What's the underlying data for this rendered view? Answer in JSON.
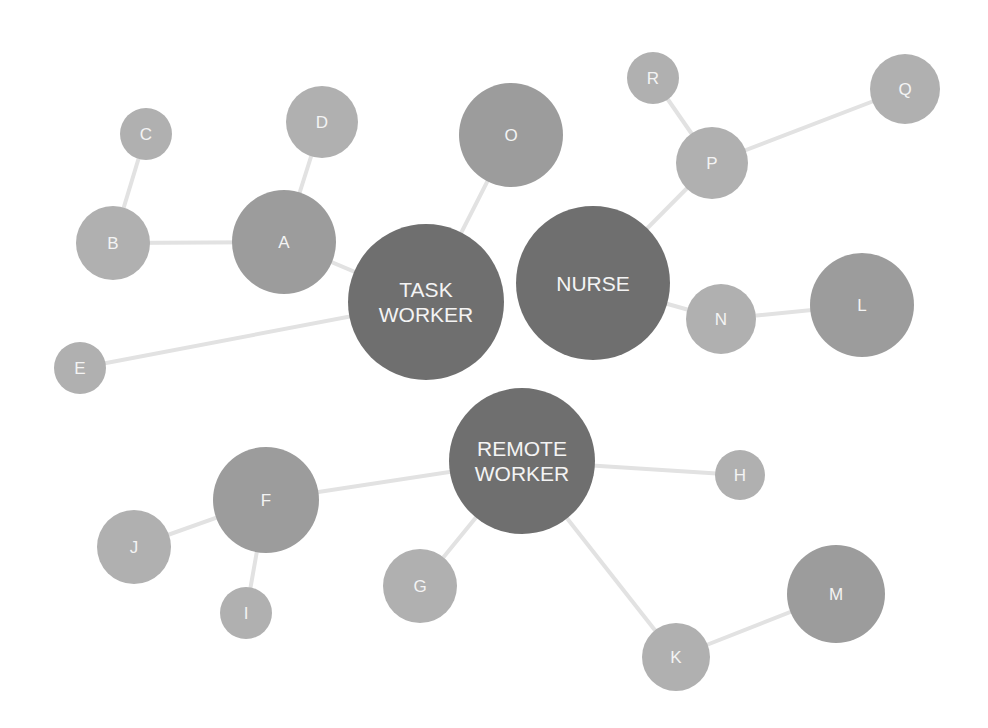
{
  "diagram": {
    "type": "network",
    "colors": {
      "background": "#ffffff",
      "edge": "#e2e2e2",
      "hub_fill": "#6f6f6f",
      "large_leaf_fill": "#9c9c9c",
      "leaf_fill": "#b0b0b0",
      "label": "#f4f4f4"
    },
    "nodes": [
      {
        "id": "task_worker",
        "label_lines": [
          "TASK",
          "WORKER"
        ],
        "x": 426,
        "y": 302,
        "r": 78,
        "kind": "hub"
      },
      {
        "id": "nurse",
        "label_lines": [
          "NURSE"
        ],
        "x": 593,
        "y": 283,
        "r": 77,
        "kind": "hub"
      },
      {
        "id": "remote_worker",
        "label_lines": [
          "REMOTE",
          "WORKER"
        ],
        "x": 522,
        "y": 461,
        "r": 73,
        "kind": "hub"
      },
      {
        "id": "A",
        "label_lines": [
          "A"
        ],
        "x": 284,
        "y": 242,
        "r": 52,
        "kind": "large"
      },
      {
        "id": "B",
        "label_lines": [
          "B"
        ],
        "x": 113,
        "y": 243,
        "r": 37,
        "kind": "leaf"
      },
      {
        "id": "C",
        "label_lines": [
          "C"
        ],
        "x": 146,
        "y": 134,
        "r": 26,
        "kind": "leaf"
      },
      {
        "id": "D",
        "label_lines": [
          "D"
        ],
        "x": 322,
        "y": 122,
        "r": 36,
        "kind": "leaf"
      },
      {
        "id": "E",
        "label_lines": [
          "E"
        ],
        "x": 80,
        "y": 368,
        "r": 26,
        "kind": "leaf"
      },
      {
        "id": "F",
        "label_lines": [
          "F"
        ],
        "x": 266,
        "y": 500,
        "r": 53,
        "kind": "large"
      },
      {
        "id": "G",
        "label_lines": [
          "G"
        ],
        "x": 420,
        "y": 586,
        "r": 37,
        "kind": "leaf"
      },
      {
        "id": "H",
        "label_lines": [
          "H"
        ],
        "x": 740,
        "y": 475,
        "r": 25,
        "kind": "leaf"
      },
      {
        "id": "I",
        "label_lines": [
          "I"
        ],
        "x": 246,
        "y": 613,
        "r": 26,
        "kind": "leaf"
      },
      {
        "id": "J",
        "label_lines": [
          "J"
        ],
        "x": 134,
        "y": 547,
        "r": 37,
        "kind": "leaf"
      },
      {
        "id": "K",
        "label_lines": [
          "K"
        ],
        "x": 676,
        "y": 657,
        "r": 34,
        "kind": "leaf"
      },
      {
        "id": "L",
        "label_lines": [
          "L"
        ],
        "x": 862,
        "y": 305,
        "r": 52,
        "kind": "large"
      },
      {
        "id": "M",
        "label_lines": [
          "M"
        ],
        "x": 836,
        "y": 594,
        "r": 49,
        "kind": "large"
      },
      {
        "id": "N",
        "label_lines": [
          "N"
        ],
        "x": 721,
        "y": 319,
        "r": 35,
        "kind": "leaf"
      },
      {
        "id": "O",
        "label_lines": [
          "O"
        ],
        "x": 511,
        "y": 135,
        "r": 52,
        "kind": "large"
      },
      {
        "id": "P",
        "label_lines": [
          "P"
        ],
        "x": 712,
        "y": 163,
        "r": 36,
        "kind": "leaf"
      },
      {
        "id": "Q",
        "label_lines": [
          "Q"
        ],
        "x": 905,
        "y": 89,
        "r": 35,
        "kind": "leaf"
      },
      {
        "id": "R",
        "label_lines": [
          "R"
        ],
        "x": 653,
        "y": 78,
        "r": 26,
        "kind": "leaf"
      }
    ],
    "edges": [
      {
        "from": "task_worker",
        "to": "A"
      },
      {
        "from": "A",
        "to": "B"
      },
      {
        "from": "A",
        "to": "D"
      },
      {
        "from": "B",
        "to": "C"
      },
      {
        "from": "task_worker",
        "to": "E"
      },
      {
        "from": "task_worker",
        "to": "O"
      },
      {
        "from": "nurse",
        "to": "P"
      },
      {
        "from": "P",
        "to": "R"
      },
      {
        "from": "P",
        "to": "Q"
      },
      {
        "from": "nurse",
        "to": "N"
      },
      {
        "from": "N",
        "to": "L"
      },
      {
        "from": "remote_worker",
        "to": "F"
      },
      {
        "from": "F",
        "to": "J"
      },
      {
        "from": "F",
        "to": "I"
      },
      {
        "from": "remote_worker",
        "to": "G"
      },
      {
        "from": "remote_worker",
        "to": "H"
      },
      {
        "from": "remote_worker",
        "to": "K"
      },
      {
        "from": "K",
        "to": "M"
      }
    ]
  }
}
